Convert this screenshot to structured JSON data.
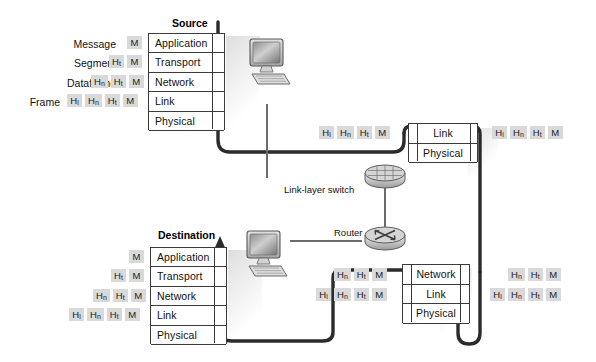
{
  "diagram": {
    "colors": {
      "chip_bg": "#d9d9d9",
      "box_border": "#3b3b3b",
      "path_stroke": "#2b2b2b",
      "thin_link": "#6b6b6b",
      "text": "#111111",
      "background": "#ffffff"
    }
  },
  "source_node": {
    "title": "Source",
    "layers": [
      {
        "name": "Application"
      },
      {
        "name": "Transport"
      },
      {
        "name": "Network"
      },
      {
        "name": "Link"
      },
      {
        "name": "Physical"
      }
    ],
    "pdu_rows": [
      {
        "label": "Message",
        "chips": [
          "M"
        ]
      },
      {
        "label": "Segment",
        "chips": [
          "Ht",
          "M"
        ]
      },
      {
        "label": "Dataframe",
        "chips": [
          "Hn",
          "Ht",
          "M"
        ]
      },
      {
        "label": "Frame",
        "chips": [
          "Hl",
          "Hn",
          "Ht",
          "M"
        ]
      }
    ]
  },
  "destination_node": {
    "title": "Destination",
    "layers": [
      {
        "name": "Application"
      },
      {
        "name": "Transport"
      },
      {
        "name": "Network"
      },
      {
        "name": "Link"
      },
      {
        "name": "Physical"
      }
    ],
    "pdu_rows": [
      {
        "chips": [
          "M"
        ]
      },
      {
        "chips": [
          "Ht",
          "M"
        ]
      },
      {
        "chips": [
          "Hn",
          "Ht",
          "M"
        ]
      },
      {
        "chips": [
          "Hl",
          "Hn",
          "Ht",
          "M"
        ]
      }
    ]
  },
  "switch_node": {
    "label": "Link-layer switch",
    "layers": [
      {
        "name": "Link"
      },
      {
        "name": "Physical"
      }
    ],
    "pdu_in": {
      "chips": [
        "Hl",
        "Hn",
        "Ht",
        "M"
      ]
    },
    "pdu_out": {
      "chips": [
        "Hl",
        "Hn",
        "Ht",
        "M"
      ]
    }
  },
  "router_node": {
    "label": "Router",
    "layers": [
      {
        "name": "Network"
      },
      {
        "name": "Link"
      },
      {
        "name": "Physical"
      }
    ],
    "pdu_in_top": {
      "chips": [
        "Hn",
        "Ht",
        "M"
      ]
    },
    "pdu_in_bottom": {
      "chips": [
        "Hl",
        "Hn",
        "Ht",
        "M"
      ]
    },
    "pdu_out_top": {
      "chips": [
        "Hn",
        "Ht",
        "M"
      ]
    },
    "pdu_out_bottom": {
      "chips": [
        "Hl",
        "Hn",
        "Ht",
        "M"
      ]
    }
  },
  "header_glyphs": {
    "M": {
      "base": "M",
      "sub": ""
    },
    "Ht": {
      "base": "H",
      "sub": "t"
    },
    "Hn": {
      "base": "H",
      "sub": "n"
    },
    "Hl": {
      "base": "H",
      "sub": "l"
    }
  },
  "icons": {
    "source_computer": "desktop-computer-icon",
    "destination_computer": "desktop-computer-icon",
    "switch": "link-layer-switch-icon",
    "router": "router-icon"
  }
}
